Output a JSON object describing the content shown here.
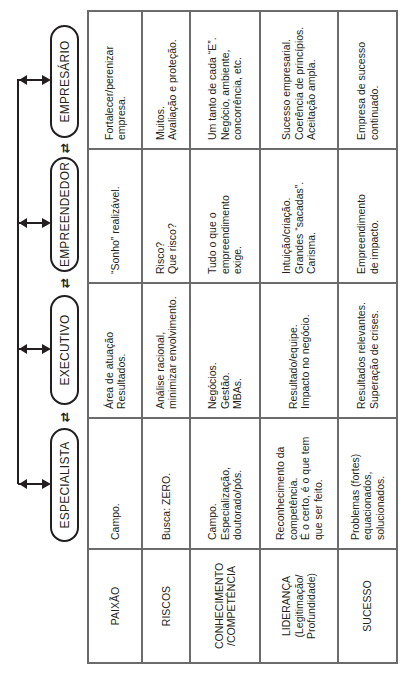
{
  "diagram": {
    "orientation": "rotated-90-ccw",
    "roles": [
      {
        "id": "especialista",
        "label": "ESPECIALISTA"
      },
      {
        "id": "executivo",
        "label": "EXECUTIVO"
      },
      {
        "id": "empreendedor",
        "label": "EMPREENDEDOR"
      },
      {
        "id": "empresario",
        "label": "EMPRESÁRIO"
      }
    ],
    "swap_symbol": "⇄",
    "criteria": [
      {
        "label": "PAIXÃO"
      },
      {
        "label": "RISCOS"
      },
      {
        "label": "CONHECIMENTO\n/COMPETÊNCIA"
      },
      {
        "label": "LIDERANÇA\n(Legitimação/\nProfundidade)"
      },
      {
        "label": "SUCESSO"
      }
    ],
    "cells": {
      "especialista": [
        "Campo.",
        "Busca: ZERO.",
        "Campo.\nEspecialização,\ndoutorado/pós.",
        "Reconhecimento da\ncompetência.\nÉ o certo, é o que tem\nque ser feito.",
        "Problemas (fortes)\nequacionados,\nsolucionados."
      ],
      "executivo": [
        "Área de atuação\nResultados.",
        "Análise racional,\nminimizar envolvimento.",
        "Negócios.\nGestão.\nMBAs.",
        "Resultado/equipe.\nImpacto no negócio.",
        "Resultados relevantes.\nSuperação de crises."
      ],
      "empreendedor": [
        "“Sonho” realizável.",
        "Risco?\nQue risco?",
        "Tudo o que o\nempreendimento\nexige.",
        "Intuição/criação.\nGrandes “sacadas”.\nCarisma.",
        "Empreendimento\nde impacto."
      ],
      "empresario": [
        "Fortalecer/perenizar\nempresa.",
        "Muitos.\nAvaliação e proteção.",
        "Um tanto de cada “E”.\nNegócio, ambiente,\nconcorrência, etc.",
        "Sucesso empresarial.\nCoerência de princípios.\nAceitação ampla.",
        "Empresa de sucesso\ncontinuado."
      ]
    }
  }
}
